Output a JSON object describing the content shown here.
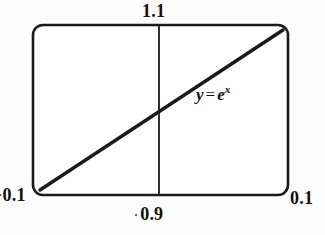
{
  "figure": {
    "kind": "line-plot",
    "curve_label": {
      "variable": "y",
      "equals": "=",
      "base": "e",
      "exponent": "x",
      "full_text": "y = e^x"
    },
    "labels": {
      "top": "1.1",
      "left": "0.1",
      "left_stray_mark": "·",
      "right": "0.1",
      "bottom": "0.9",
      "bottom_stray_mark": "·"
    },
    "colors": {
      "stroke": "#1a1a1a",
      "frame": "#1a1a1a",
      "background": "#fdfdfd",
      "text": "#111111"
    },
    "geometry": {
      "frame_x": 33,
      "frame_y": 25,
      "frame_width": 255,
      "frame_height": 170,
      "corner_radius": 10,
      "divider_x": 159,
      "frame_stroke_width": 2.6,
      "divider_stroke_width": 1.8,
      "curve_stroke_width": 3.4
    }
  },
  "chart_data": {
    "type": "line",
    "title": "",
    "xlabel": "",
    "ylabel": "",
    "grid": false,
    "legend": "none",
    "annotations": [
      {
        "text": "y = e^x",
        "x": 0.64,
        "y": 0.55
      }
    ],
    "xlim": [
      0.1,
      0.1
    ],
    "ylim": [
      0.9,
      1.1
    ],
    "axis_ticks": {
      "top": "1.1",
      "bottom": "0.9",
      "left": "0.1",
      "right": "0.1"
    },
    "divider_line": {
      "orientation": "vertical",
      "position_fraction": 0.494
    },
    "series": [
      {
        "name": "y = e^x",
        "x": [
          0.0,
          0.125,
          0.25,
          0.375,
          0.5,
          0.625,
          0.75,
          0.875,
          1.0
        ],
        "values": [
          0.0,
          0.125,
          0.25,
          0.375,
          0.5,
          0.625,
          0.75,
          0.875,
          1.0
        ],
        "description": "near-linear rise from bottom-left corner to top-right corner"
      }
    ]
  }
}
